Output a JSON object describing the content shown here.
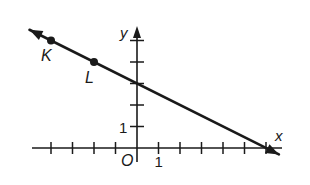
{
  "diagram": {
    "type": "coordinate-plane-line",
    "axes": {
      "x_label": "x",
      "y_label": "y",
      "origin_label": "O",
      "x_tick_label": "1",
      "y_tick_label": "1",
      "x_ticks": [
        -4,
        -3,
        -2,
        -1,
        1,
        2,
        3,
        4,
        5,
        6
      ],
      "y_ticks": [
        1,
        2,
        3,
        4,
        5
      ],
      "x_range": [
        -5,
        7
      ],
      "y_range": [
        -0.5,
        6
      ]
    },
    "line": {
      "slope": -0.5,
      "y_intercept": 3,
      "x_intercept": 6,
      "arrow_ends": [
        -5,
        6.6
      ]
    },
    "points": [
      {
        "label": "K",
        "x": -4,
        "y": 5
      },
      {
        "label": "L",
        "x": -2,
        "y": 4
      }
    ],
    "colors": {
      "ink": "#1a1a1a",
      "background": "#ffffff"
    }
  }
}
